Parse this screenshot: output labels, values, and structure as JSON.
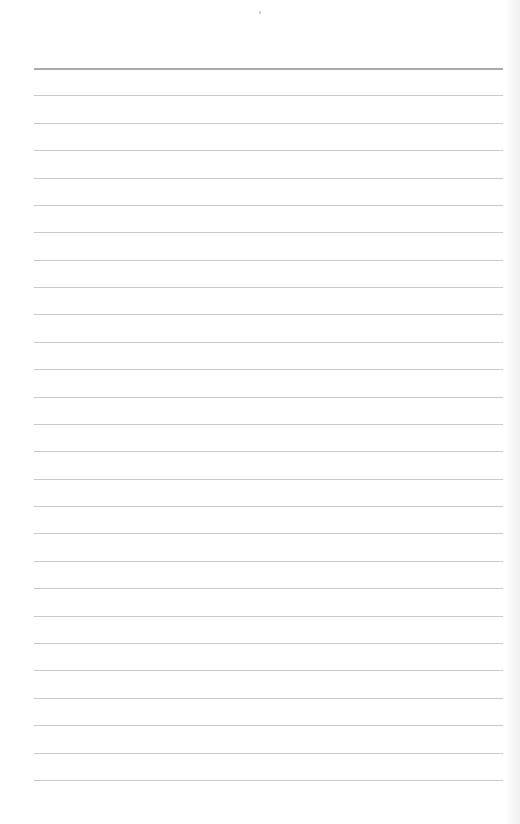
{
  "page": {
    "type": "lined-paper",
    "background_color": "#ffffff",
    "rule_color": "#c9c9c9",
    "header_rule_color": "#a9a9a9",
    "rule_count": 27,
    "first_rule_y": 68,
    "rule_spacing": 27.38,
    "rule_left": 34,
    "rule_width": 469,
    "page_mark": "small dot at top center"
  }
}
